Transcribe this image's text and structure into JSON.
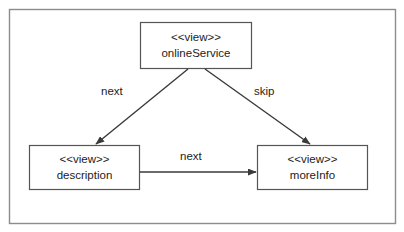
{
  "diagram": {
    "frame": {
      "x": 9,
      "y": 9,
      "width": 387,
      "height": 215,
      "border_color": "#8c8c8c"
    },
    "background_color": "#ffffff",
    "line_color": "#3a3a3a",
    "text_color": "#1c1c1c",
    "nodes": [
      {
        "id": "onlineService",
        "stereotype": "<<view>>",
        "name": "onlineService",
        "x": 140,
        "y": 22,
        "width": 112,
        "height": 47
      },
      {
        "id": "description",
        "stereotype": "<<view>>",
        "name": "description",
        "x": 29,
        "y": 145,
        "width": 111,
        "height": 45
      },
      {
        "id": "moreInfo",
        "stereotype": "<<view>>",
        "name": "moreInfo",
        "x": 257,
        "y": 145,
        "width": 111,
        "height": 45
      }
    ],
    "edges": [
      {
        "id": "onlineService-to-description",
        "label": "next",
        "from": "onlineService",
        "to": "description",
        "x1": 188,
        "y1": 69,
        "x2": 96,
        "y2": 144,
        "label_x": 101,
        "label_y": 85
      },
      {
        "id": "onlineService-to-moreInfo",
        "label": "skip",
        "from": "onlineService",
        "to": "moreInfo",
        "x1": 205,
        "y1": 69,
        "x2": 310,
        "y2": 144,
        "label_x": 254,
        "label_y": 85
      },
      {
        "id": "description-to-moreInfo",
        "label": "next",
        "from": "description",
        "to": "moreInfo",
        "x1": 140,
        "y1": 172,
        "x2": 256,
        "y2": 172,
        "label_x": 180,
        "label_y": 150
      }
    ]
  }
}
